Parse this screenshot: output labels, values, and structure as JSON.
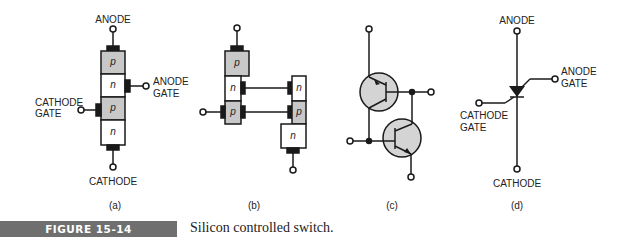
{
  "figure": {
    "number": "FIGURE 15-14",
    "caption": "Silicon controlled switch.",
    "colors": {
      "semiconductor_p": "#c8c8c8",
      "transistor_fill": "#d4d4d4",
      "line": "#1a1a1a",
      "bar": "#6f6f6f"
    }
  },
  "panels": {
    "a": {
      "sublabel": "(a)",
      "anode": "ANODE",
      "anode_gate_1": "ANODE",
      "anode_gate_2": "GATE",
      "cathode_gate_1": "CATHODE",
      "cathode_gate_2": "GATE",
      "cathode": "CATHODE",
      "layers": [
        "p",
        "n",
        "p",
        "n"
      ]
    },
    "b": {
      "sublabel": "(b)",
      "left_layers": [
        "p",
        "n",
        "p"
      ],
      "right_layers": [
        "n",
        "p",
        "n"
      ]
    },
    "c": {
      "sublabel": "(c)"
    },
    "d": {
      "sublabel": "(d)",
      "anode": "ANODE",
      "anode_gate_1": "ANODE",
      "anode_gate_2": "GATE",
      "cathode_gate_1": "CATHODE",
      "cathode_gate_2": "GATE",
      "cathode": "CATHODE"
    }
  }
}
